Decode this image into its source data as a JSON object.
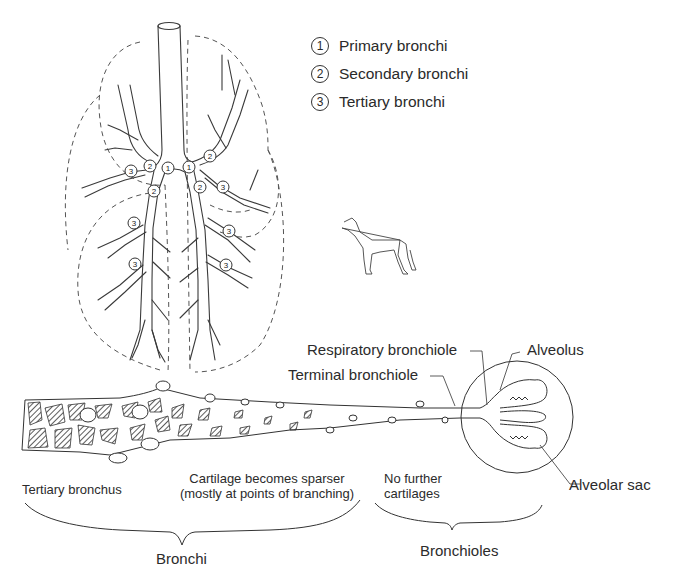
{
  "legend": {
    "items": [
      {
        "num": "1",
        "label": "Primary bronchi"
      },
      {
        "num": "2",
        "label": "Secondary bronchi"
      },
      {
        "num": "3",
        "label": "Tertiary bronchi"
      }
    ]
  },
  "lung_markers": {
    "primary": "1",
    "secondary": "2",
    "tertiary": "3"
  },
  "airway_labels": {
    "respiratory_bronchiole": "Respiratory bronchiole",
    "terminal_bronchiole": "Terminal bronchiole",
    "alveolus": "Alveolus",
    "alveolar_sac": "Alveolar sac"
  },
  "section_captions": {
    "tertiary_bronchus": "Tertiary bronchus",
    "cartilage_line1": "Cartilage becomes sparser",
    "cartilage_line2": "(mostly at points of branching)",
    "no_cartilage_line1": "No further",
    "no_cartilage_line2": "cartilages"
  },
  "brace_labels": {
    "bronchi": "Bronchi",
    "bronchioles": "Bronchioles"
  },
  "colors": {
    "line": "#3a3a3a",
    "dashed_outline": "#555555",
    "hatch": "#333333",
    "background": "#ffffff"
  }
}
